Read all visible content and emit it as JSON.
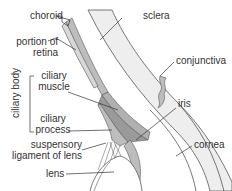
{
  "diagram": {
    "labels": {
      "choroid": "choroid",
      "sclera": "sclera",
      "retina_line1": "portion of",
      "retina_line2": "retina",
      "conjunctiva": "conjunctiva",
      "ciliary_body": "ciliary body",
      "ciliary_muscle_line1": "ciliary",
      "ciliary_muscle_line2": "muscle",
      "ciliary_process_line1": "ciliary",
      "ciliary_process_line2": "process",
      "iris": "iris",
      "suspensory_line1": "suspensory",
      "suspensory_line2": "ligament of lens",
      "cornea": "cornea",
      "lens": "lens"
    },
    "colors": {
      "background": "#ffffff",
      "sclera_fill": "#eeeeee",
      "muscle_fill": "#9a9a9a",
      "tissue_fill": "#bdbdbd",
      "line": "#333333",
      "outline": "#555555"
    }
  }
}
